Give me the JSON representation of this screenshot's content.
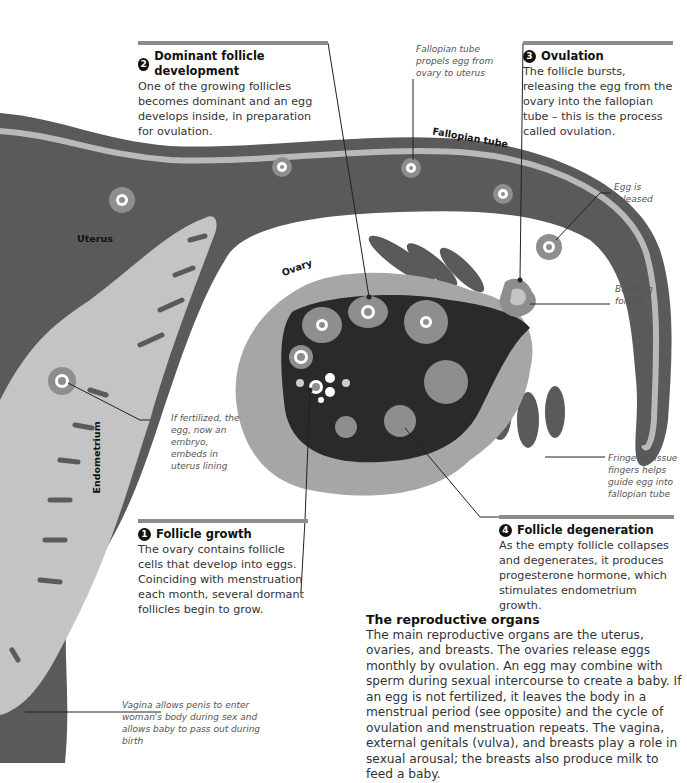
{
  "colors": {
    "tissue_dark": "#5a5a5a",
    "tissue_light": "#b9b9b9",
    "ovary_outer": "#a6a6a6",
    "ovary_inner": "#2a2a2a",
    "follicle": "#8e8e8e",
    "rule": "#8c8c8c",
    "text": "#333333"
  },
  "labels": {
    "uterus": "Uterus",
    "ovary": "Ovary",
    "fallopian_tube": "Fallopian tube",
    "endometrium": "Endometrium"
  },
  "notes": {
    "fallopian_propels": "Fallopian tube propels egg from ovary to uterus",
    "egg_released": "Egg is released",
    "bursting_follicle": "Bursting follicle",
    "if_fertilized": "If fertilized, the egg, now an embryo, embeds in uterus lining",
    "fringe": "Fringe of tissue fingers helps guide egg into fallopian tube",
    "vagina": "Vagina allows penis to enter woman's body during sex and allows baby to pass out during birth"
  },
  "steps": [
    {
      "number": "1",
      "title": "Follicle growth",
      "text": "The ovary contains follicle cells that develop into eggs. Coinciding with menstruation each month, several dormant follicles begin to grow."
    },
    {
      "number": "2",
      "title": "Dominant follicle development",
      "text": "One of the growing follicles becomes dominant and an egg develops inside, in preparation for ovulation."
    },
    {
      "number": "3",
      "title": "Ovulation",
      "text": "The follicle bursts, releasing the egg from the ovary into the fallopian tube – this is the process called ovulation."
    },
    {
      "number": "4",
      "title": "Follicle degeneration",
      "text": "As the empty follicle collapses and degenerates, it produces progesterone hormone, which stimulates endometrium growth."
    }
  ],
  "summary": {
    "title": "The reproductive organs",
    "text": "The main reproductive organs are the uterus, ovaries, and breasts. The ovaries release eggs monthly by ovulation. An egg may combine with sperm during sexual intercourse to create a baby. If an egg is not fertilized, it leaves the body in a menstrual period (see opposite) and the cycle of ovulation and menstruation repeats. The vagina, external genitals (vulva), and breasts play a role in sexual arousal; the breasts also produce milk to feed a baby."
  }
}
